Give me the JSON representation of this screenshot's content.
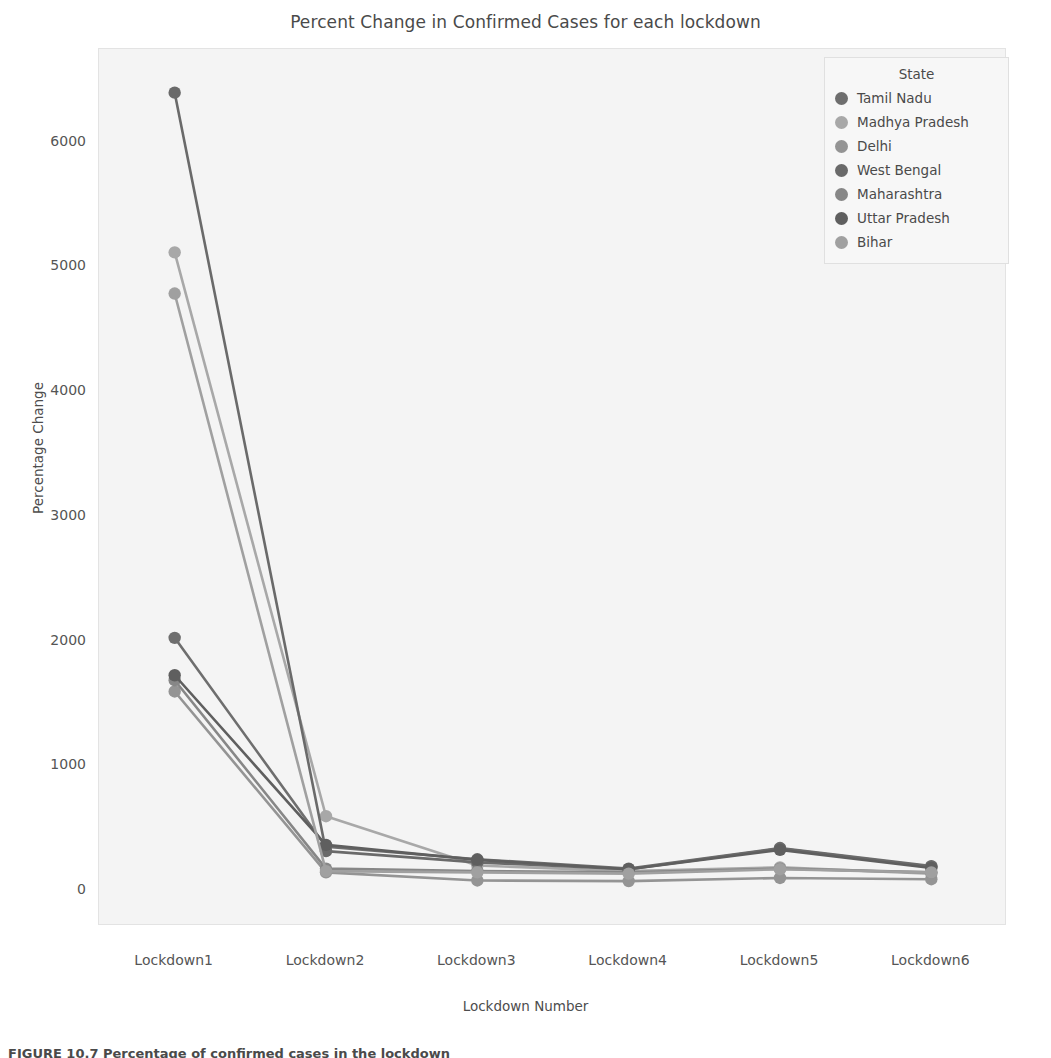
{
  "figure": {
    "title": "Percent Change in Confirmed Cases for each lockdown",
    "caption": "FIGURE 10.7  Percentage of confirmed cases in the lockdown"
  },
  "legend": {
    "title": "State"
  },
  "chart_data": {
    "type": "line",
    "title": "Percent Change in Confirmed Cases for each lockdown",
    "xlabel": "Lockdown Number",
    "ylabel": "Percentage Change",
    "categories": [
      "Lockdown1",
      "Lockdown2",
      "Lockdown3",
      "Lockdown4",
      "Lockdown5",
      "Lockdown6"
    ],
    "yticks": [
      0,
      1000,
      2000,
      3000,
      4000,
      5000,
      6000
    ],
    "ylim": [
      -280,
      6750
    ],
    "grid": false,
    "legend_position": "upper right",
    "series": [
      {
        "name": "Tamil Nadu",
        "color": "#6e6e6e",
        "values": [
          2030,
          355,
          255,
          180,
          345,
          200
        ]
      },
      {
        "name": "Madhya Pradesh",
        "color": "#a8a8a8",
        "values": [
          5120,
          600,
          205,
          160,
          190,
          140
        ]
      },
      {
        "name": "Delhi",
        "color": "#949494",
        "values": [
          1600,
          150,
          85,
          80,
          105,
          95
        ]
      },
      {
        "name": "West Bengal",
        "color": "#6a6a6a",
        "values": [
          6400,
          320,
          230,
          175,
          340,
          195
        ]
      },
      {
        "name": "Maharashtra",
        "color": "#878787",
        "values": [
          1690,
          180,
          160,
          150,
          180,
          150
        ]
      },
      {
        "name": "Uttar Pradesh",
        "color": "#5f5f5f",
        "values": [
          1730,
          370,
          250,
          175,
          330,
          185
        ]
      },
      {
        "name": "Bihar",
        "color": "#a0a0a0",
        "values": [
          4790,
          160,
          150,
          140,
          175,
          150
        ]
      }
    ]
  }
}
